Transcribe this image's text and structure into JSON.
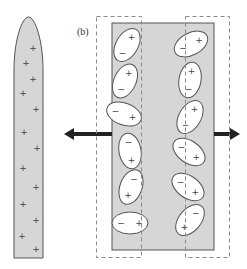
{
  "figure": {
    "panel_label": "(b)",
    "colors": {
      "shape_fill": "#d6d6d6",
      "shape_stroke": "#555555",
      "dashed_stroke": "#8a8a8a",
      "ellipse_fill": "#ffffff",
      "arrow": "#222222",
      "sign": "#444444"
    },
    "left_object": {
      "description": "elongated rounded body with positive charges",
      "charges": [
        "+",
        "+",
        "+",
        "+",
        "+",
        "+",
        "+",
        "+",
        "+",
        "+",
        "+",
        "+",
        "+",
        "+"
      ]
    },
    "dipoles": {
      "description": "polarized molecules (ellipses) with separated charges inside slab",
      "left_column": [
        {
          "pos": "+",
          "neg": "−"
        },
        {
          "pos": "+",
          "neg": "−"
        },
        {
          "pos": "+",
          "neg": "−"
        },
        {
          "pos": "+",
          "neg": "−"
        },
        {
          "pos": "+",
          "neg": "−"
        },
        {
          "pos": "+",
          "neg": "−"
        }
      ],
      "right_column": [
        {
          "pos": "+",
          "neg": "−"
        },
        {
          "pos": "+",
          "neg": "−"
        },
        {
          "pos": "+",
          "neg": "−"
        },
        {
          "pos": "+",
          "neg": "−"
        },
        {
          "pos": "+",
          "neg": "−"
        },
        {
          "pos": "+",
          "neg": "−"
        }
      ]
    },
    "arrows": [
      {
        "name": "left-arrow",
        "direction": "left"
      },
      {
        "name": "right-arrow",
        "direction": "right"
      }
    ],
    "dashed_regions": [
      "left-dashed-region",
      "right-dashed-region"
    ]
  }
}
